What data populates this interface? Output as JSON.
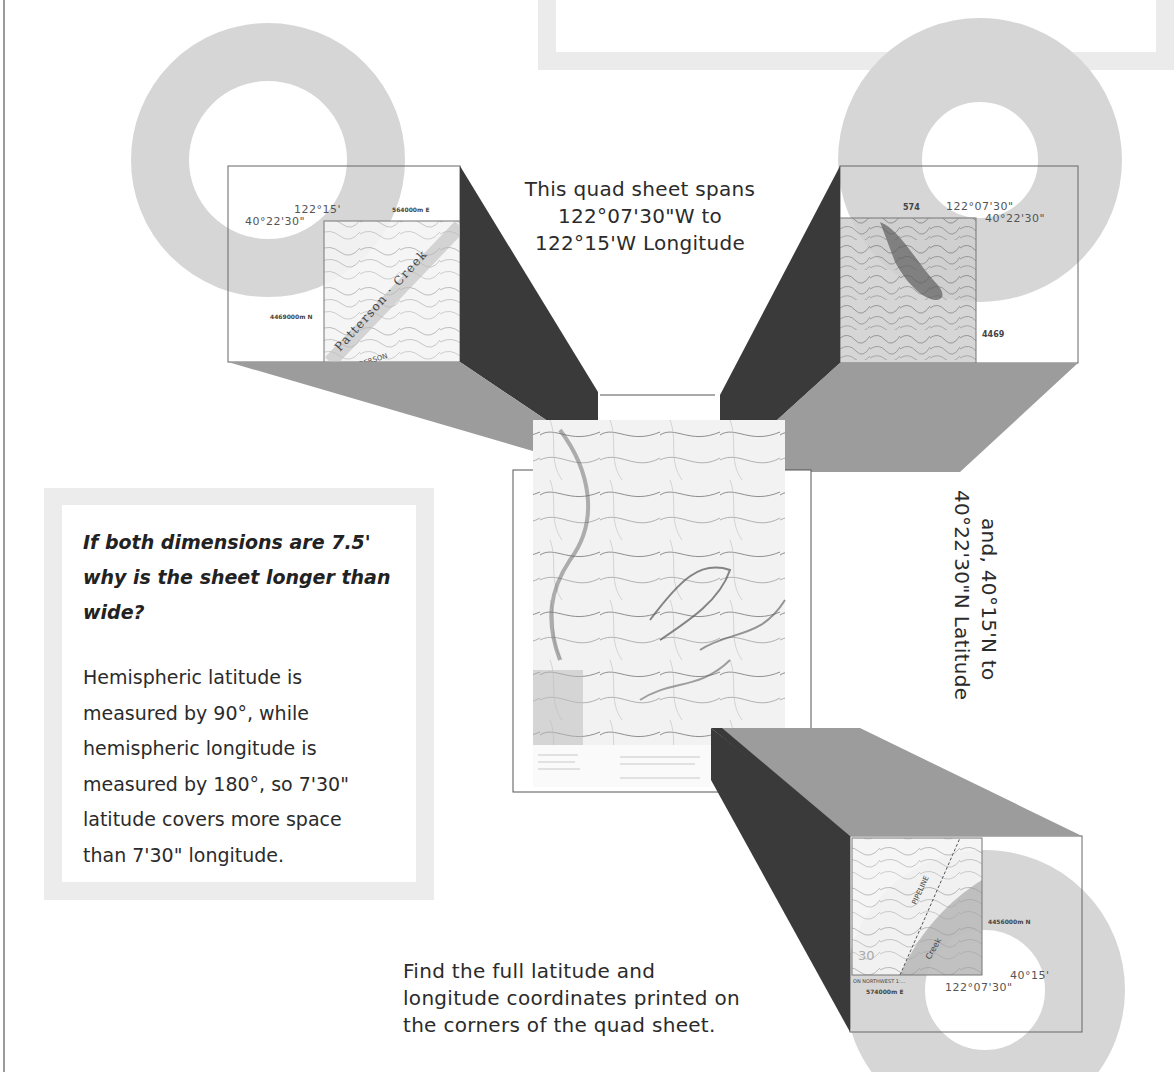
{
  "diagram": {
    "colors": {
      "background": "#ffffff",
      "ring_gray": "#d8d8d8",
      "dark_bevel": "#3a3a3a",
      "light_bevel": "#9c9c9c",
      "box_border": "#ebebeb"
    }
  },
  "captions": {
    "longitude_span": "This quad sheet spans 122°07'30\"W to 122°15'W Longitude",
    "longitude_lines": [
      "This quad sheet spans",
      "122°07'30\"W to",
      "122°15'W Longitude"
    ],
    "latitude_span": "and, 40°15'N to 40°22'30\"N Latitude",
    "latitude_lines": [
      "and, 40°15'N to",
      "40°22'30\"N Latitude"
    ],
    "instruction_lines": [
      "Find the full latitude and",
      "longitude coordinates printed on",
      "the corners of the quad sheet."
    ]
  },
  "question_box": {
    "question_lines": [
      "If both dimensions are 7.5'",
      "why is the sheet longer than",
      "wide?"
    ],
    "answer_lines": [
      "Hemispheric latitude is",
      "measured by 90°, while",
      "hemispheric longitude is",
      "measured by 180°, so 7'30\"",
      "latitude covers more space",
      "than 7'30\" longitude."
    ]
  },
  "callouts": {
    "top_left": {
      "longitude": "122°15'",
      "latitude": "40°22'30\"",
      "utm_e": "564000m E",
      "utm_n": "4469000m N",
      "map_labels": [
        "Patterson",
        "Creek",
        "ANDERSON"
      ]
    },
    "top_right": {
      "longitude": "122°07'30\"",
      "latitude": "40°22'30\"",
      "utm_e": "574",
      "utm_n": "4469",
      "contour_label": "1090"
    },
    "bottom_right": {
      "latitude": "40°15'",
      "longitude": "122°07'30\"",
      "utm_e": "574000m E",
      "utm_n": "4456000m N",
      "contour_label": "30",
      "map_labels": [
        "PIPELINE",
        "Creek"
      ],
      "margin_note": "ON NORTHWEST 1:..."
    }
  },
  "center_map": {
    "label": "Quad sheet (reduced)"
  }
}
